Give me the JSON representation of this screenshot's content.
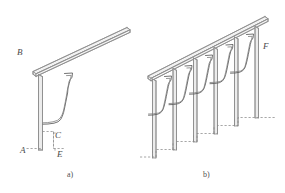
{
  "figure": {
    "background_color": "#ffffff",
    "line_color": "#8a8a8a",
    "dark_line_color": "#4a4a4a",
    "label_color": "#4a4a4a",
    "width": 285,
    "height": 193
  },
  "panels": [
    {
      "id": "panel-a",
      "caption": "a)",
      "description": "Single newel post with inclined handrail and stepped baluster profile",
      "labels": [
        {
          "key": "B",
          "text": "B",
          "x": 17,
          "y": 48,
          "refers_to": "handrail-upper-end"
        },
        {
          "key": "A",
          "text": "A",
          "x": 20,
          "y": 146,
          "refers_to": "post-base"
        },
        {
          "key": "C",
          "text": "C",
          "x": 55,
          "y": 131,
          "refers_to": "step-riser"
        },
        {
          "key": "E",
          "text": "E",
          "x": 57,
          "y": 150,
          "refers_to": "step-tread"
        }
      ]
    },
    {
      "id": "panel-b",
      "caption": "b)",
      "description": "Full balustrade run of six posts along a stair flight with inclined handrail",
      "labels": [
        {
          "key": "F",
          "text": "F",
          "x": 263,
          "y": 42,
          "refers_to": "end-post-top"
        }
      ],
      "post_count": 6,
      "step_count": 5
    }
  ],
  "labels_all": {
    "B": "B",
    "A": "A",
    "C": "C",
    "E": "E",
    "F": "F",
    "caption_a": "a)",
    "caption_b": "b)"
  }
}
